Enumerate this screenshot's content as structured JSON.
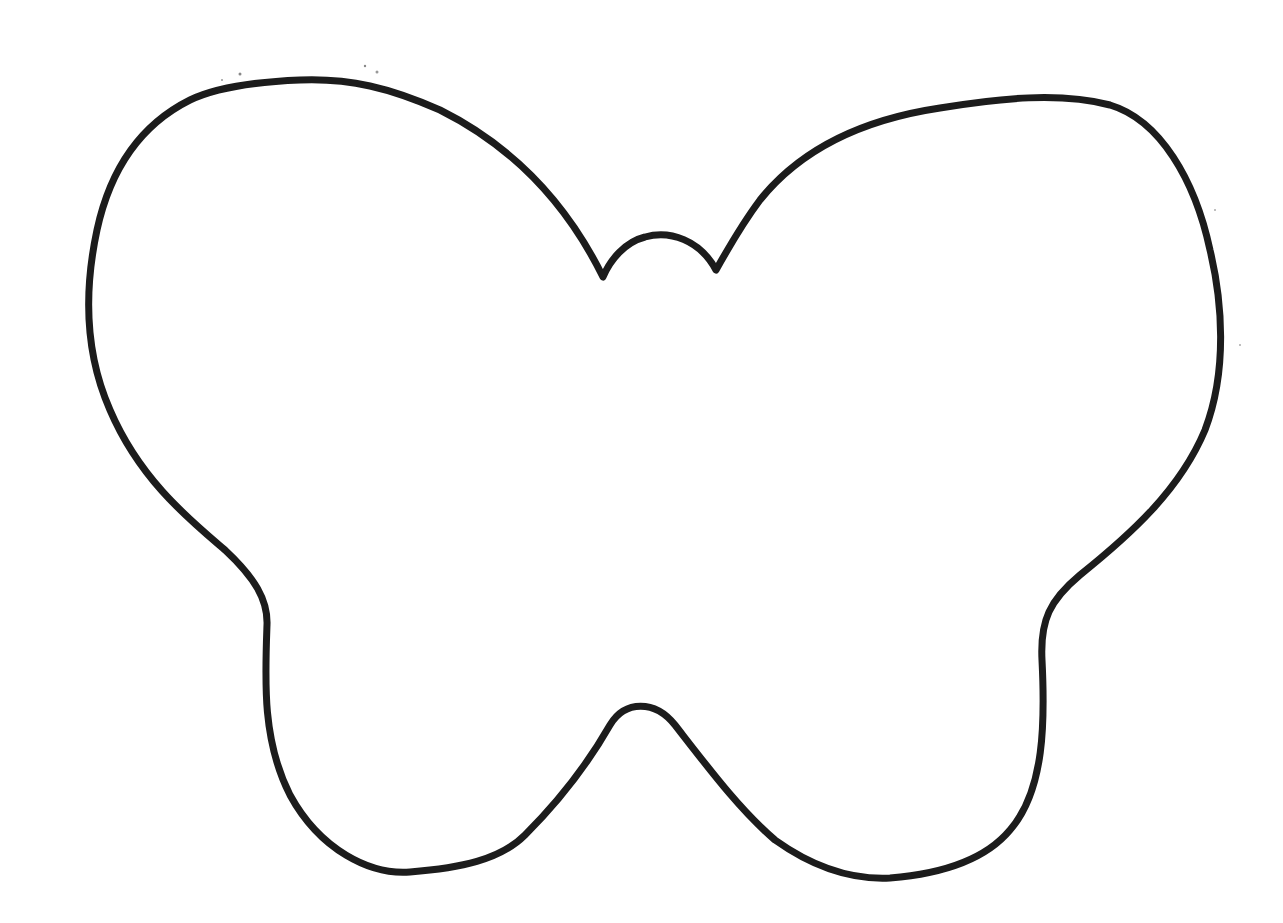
{
  "image": {
    "subject": "butterfly-outline",
    "background": "#ffffff",
    "stroke_color": "#1c1c1c",
    "stroke_width": 7
  }
}
